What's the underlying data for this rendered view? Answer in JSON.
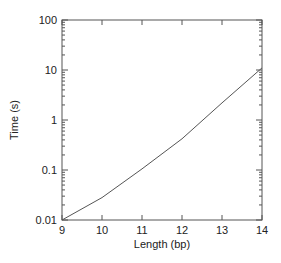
{
  "chart_data": {
    "type": "line",
    "title": "",
    "xlabel": "Length (bp)",
    "ylabel": "Time (s)",
    "x": [
      9,
      10,
      11,
      12,
      13,
      14
    ],
    "series": [
      {
        "name": "Time",
        "values": [
          0.01,
          0.028,
          0.105,
          0.42,
          2.2,
          11
        ]
      }
    ],
    "xlim": [
      9,
      14
    ],
    "ylim": [
      0.01,
      100
    ],
    "yscale": "log",
    "xticks": [
      "9",
      "10",
      "11",
      "12",
      "13",
      "14"
    ],
    "yticks": [
      "0.01",
      "0.1",
      "1",
      "10",
      "100"
    ],
    "grid": false,
    "legend": null,
    "line_color": "#555555"
  }
}
